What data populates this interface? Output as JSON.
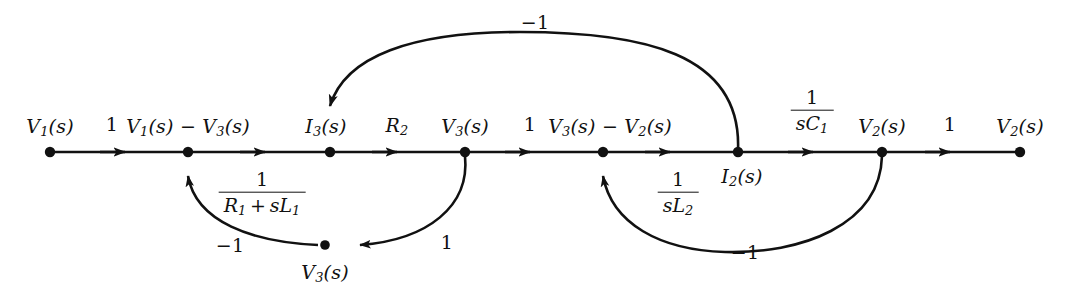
{
  "figure": {
    "type": "signal-flow-graph",
    "background": "#ffffff",
    "stroke_color": "#111111"
  },
  "nodes": [
    {
      "id": "n1",
      "label": "V1(s)",
      "x": 50,
      "y": 152,
      "label_x": 50,
      "label_y": 126,
      "label_pos": "above"
    },
    {
      "id": "n2",
      "label": "V1(s) - V3(s)",
      "x": 188,
      "y": 152,
      "label_x": 188,
      "label_y": 126,
      "label_pos": "above"
    },
    {
      "id": "n3",
      "label": "I3(s)",
      "x": 330,
      "y": 152,
      "label_x": 326,
      "label_y": 126,
      "label_pos": "above"
    },
    {
      "id": "n4",
      "label": "V3(s)",
      "x": 465,
      "y": 152,
      "label_x": 465,
      "label_y": 126,
      "label_pos": "above"
    },
    {
      "id": "n5",
      "label": "V3(s) - V2(s)",
      "x": 603,
      "y": 152,
      "label_x": 610,
      "label_y": 126,
      "label_pos": "above"
    },
    {
      "id": "n6",
      "label": "I2(s)",
      "x": 738,
      "y": 152,
      "label_x": 742,
      "label_y": 176,
      "label_pos": "below"
    },
    {
      "id": "n7",
      "label": "V2(s)",
      "x": 882,
      "y": 152,
      "label_x": 882,
      "label_y": 126,
      "label_pos": "above"
    },
    {
      "id": "n8",
      "label": "V2(s)",
      "x": 1020,
      "y": 152,
      "label_x": 1020,
      "label_y": 126,
      "label_pos": "above"
    },
    {
      "id": "n9",
      "label": "V3(s)",
      "x": 325,
      "y": 245,
      "label_x": 325,
      "label_y": 272,
      "label_pos": "below"
    }
  ],
  "edges": [
    {
      "id": "e1",
      "from": "n1",
      "to": "n2",
      "gain": "1",
      "gain_x": 112,
      "gain_y": 124,
      "kind": "straight"
    },
    {
      "id": "e2",
      "from": "n2",
      "to": "n3",
      "gain": "1/(R1+sL1)",
      "gain_x": 262,
      "gain_y": 192,
      "kind": "straight"
    },
    {
      "id": "e3",
      "from": "n3",
      "to": "n4",
      "gain": "R2",
      "gain_x": 397,
      "gain_y": 125,
      "kind": "straight"
    },
    {
      "id": "e4",
      "from": "n4",
      "to": "n5",
      "gain": "1",
      "gain_x": 530,
      "gain_y": 124,
      "kind": "straight"
    },
    {
      "id": "e5",
      "from": "n5",
      "to": "n6",
      "gain": "1/(sL2)",
      "gain_x": 678,
      "gain_y": 192,
      "kind": "straight"
    },
    {
      "id": "e6",
      "from": "n6",
      "to": "n7",
      "gain": "1/(sC1)",
      "gain_x": 812,
      "gain_y": 110,
      "kind": "straight"
    },
    {
      "id": "e7",
      "from": "n7",
      "to": "n8",
      "gain": "1",
      "gain_x": 950,
      "gain_y": 124,
      "kind": "straight"
    },
    {
      "id": "e8",
      "from": "n6",
      "to": "n3",
      "gain": "-1",
      "gain_x": 535,
      "gain_y": 22,
      "kind": "arc-top"
    },
    {
      "id": "e9",
      "from": "n4",
      "to": "n9",
      "gain": "1",
      "gain_x": 447,
      "gain_y": 242,
      "kind": "arc-bottom"
    },
    {
      "id": "e10",
      "from": "n9",
      "to": "n2",
      "gain": "-1",
      "gain_x": 230,
      "gain_y": 245,
      "kind": "arc-bottom"
    },
    {
      "id": "e11",
      "from": "n7",
      "to": "n5",
      "gain": "-1",
      "gain_x": 745,
      "gain_y": 252,
      "kind": "arc-bottom"
    }
  ],
  "labels": {
    "node_V1": "V",
    "node_I3": "I",
    "node_R2": "R",
    "gain_one": "1",
    "gain_minus_one": "−1",
    "gain_R2_sub": "2",
    "frac_RL_num": "1",
    "frac_RL_den_R": "R",
    "frac_RL_den_plus": "+",
    "frac_RL_den_s": "s",
    "frac_RL_den_L": "L",
    "frac_sL2_num": "1",
    "frac_sL2_den": "sL",
    "frac_sC1_num": "1",
    "frac_sC1_den": "sC",
    "sub_1": "1",
    "sub_2": "2",
    "sub_3": "3",
    "paren_s": "(s)",
    "minus": "−"
  }
}
